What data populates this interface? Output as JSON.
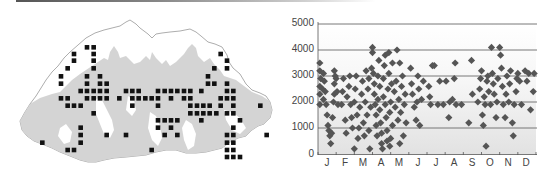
{
  "map": {
    "title": "",
    "description": "Distribution map of records (black squares) over Bhutan, grey shading = forest/lowland relief",
    "grid": {
      "x0": 42.3,
      "dx": 6.47,
      "y0": 47.3,
      "dy": 7.3,
      "cell": 4.6
    },
    "colors": {
      "square": "#111111",
      "relief": "#d4d4d4",
      "outline": "#8a8a8a",
      "land": "#ffffff"
    },
    "squares_3x": [
      [
        261,
        97
      ],
      [
        281,
        97
      ],
      [
        222,
        117
      ],
      [
        281,
        117
      ],
      [
        662,
        117
      ],
      [
        222,
        137
      ],
      [
        281,
        137
      ],
      [
        681,
        137
      ],
      [
        203,
        160
      ],
      [
        281,
        160
      ],
      [
        643,
        160
      ],
      [
        681,
        160
      ],
      [
        183,
        184
      ],
      [
        261,
        184
      ],
      [
        300,
        184
      ],
      [
        624,
        184
      ],
      [
        183,
        206
      ],
      [
        261,
        206
      ],
      [
        300,
        206
      ],
      [
        320,
        206
      ],
      [
        624,
        206
      ],
      [
        643,
        206
      ],
      [
        681,
        206
      ],
      [
        242,
        228
      ],
      [
        261,
        228
      ],
      [
        281,
        228
      ],
      [
        300,
        228
      ],
      [
        320,
        228
      ],
      [
        378,
        228
      ],
      [
        397,
        228
      ],
      [
        416,
        228
      ],
      [
        474,
        228
      ],
      [
        494,
        228
      ],
      [
        513,
        228
      ],
      [
        532,
        228
      ],
      [
        552,
        228
      ],
      [
        571,
        228
      ],
      [
        604,
        228
      ],
      [
        681,
        228
      ],
      [
        700,
        228
      ],
      [
        183,
        250
      ],
      [
        203,
        250
      ],
      [
        261,
        250
      ],
      [
        281,
        250
      ],
      [
        300,
        250
      ],
      [
        320,
        250
      ],
      [
        358,
        250
      ],
      [
        397,
        250
      ],
      [
        416,
        250
      ],
      [
        436,
        250
      ],
      [
        455,
        250
      ],
      [
        474,
        250
      ],
      [
        513,
        250
      ],
      [
        552,
        250
      ],
      [
        571,
        250
      ],
      [
        662,
        250
      ],
      [
        681,
        250
      ],
      [
        700,
        250
      ],
      [
        203,
        272
      ],
      [
        222,
        272
      ],
      [
        242,
        272
      ],
      [
        397,
        272
      ],
      [
        474,
        272
      ],
      [
        571,
        272
      ],
      [
        591,
        272
      ],
      [
        610,
        272
      ],
      [
        629,
        272
      ],
      [
        662,
        272
      ],
      [
        700,
        272
      ],
      [
        781,
        272
      ],
      [
        281,
        295
      ],
      [
        571,
        295
      ],
      [
        591,
        295
      ],
      [
        610,
        295
      ],
      [
        629,
        295
      ],
      [
        649,
        295
      ],
      [
        681,
        295
      ],
      [
        700,
        295
      ],
      [
        474,
        316
      ],
      [
        494,
        316
      ],
      [
        513,
        316
      ],
      [
        532,
        316
      ],
      [
        604,
        316
      ],
      [
        720,
        316
      ],
      [
        242,
        338
      ],
      [
        474,
        338
      ],
      [
        513,
        338
      ],
      [
        700,
        338
      ],
      [
        242,
        360
      ],
      [
        320,
        360
      ],
      [
        378,
        360
      ],
      [
        494,
        360
      ],
      [
        532,
        360
      ],
      [
        681,
        360
      ],
      [
        700,
        360
      ],
      [
        800,
        360
      ],
      [
        127,
        383
      ],
      [
        242,
        383
      ],
      [
        681,
        383
      ],
      [
        700,
        383
      ],
      [
        203,
        405
      ],
      [
        222,
        405
      ],
      [
        455,
        405
      ],
      [
        681,
        405
      ],
      [
        700,
        405
      ],
      [
        681,
        426
      ],
      [
        700,
        426
      ],
      [
        720,
        426
      ]
    ]
  },
  "chart_data": {
    "type": "scatter",
    "title": "",
    "xlabel": "",
    "ylabel": "",
    "categories": [
      "J",
      "F",
      "M",
      "A",
      "M",
      "J",
      "J",
      "A",
      "S",
      "O",
      "N",
      "D"
    ],
    "yticks": [
      0,
      1000,
      2000,
      3000,
      4000,
      5000
    ],
    "ylim": [
      0,
      5000
    ],
    "xlim": [
      0,
      12
    ],
    "grid": "horizontal",
    "legend": "none",
    "marker": "diamond",
    "marker_color": "#555555",
    "background": "gradient white (top) to light grey (bottom)",
    "series": [
      {
        "name": "records",
        "points": [
          [
            0.1,
            3500
          ],
          [
            0.1,
            3200
          ],
          [
            0.15,
            2900
          ],
          [
            0.1,
            2600
          ],
          [
            0.1,
            2300
          ],
          [
            0.1,
            1900
          ],
          [
            0.25,
            2500
          ],
          [
            0.3,
            2100
          ],
          [
            0.3,
            3100
          ],
          [
            0.35,
            2800
          ],
          [
            0.4,
            2400
          ],
          [
            0.45,
            1900
          ],
          [
            0.5,
            1500
          ],
          [
            0.55,
            1100
          ],
          [
            0.6,
            900
          ],
          [
            0.65,
            700
          ],
          [
            0.7,
            400
          ],
          [
            0.75,
            800
          ],
          [
            0.8,
            1400
          ],
          [
            0.85,
            2000
          ],
          [
            0.9,
            2300
          ],
          [
            0.9,
            2700
          ],
          [
            0.95,
            3000
          ],
          [
            0.9,
            3200
          ],
          [
            1.0,
            2900
          ],
          [
            1.05,
            2400
          ],
          [
            1.1,
            1900
          ],
          [
            1.3,
            1900
          ],
          [
            1.35,
            2400
          ],
          [
            1.4,
            2900
          ],
          [
            1.5,
            1300
          ],
          [
            1.55,
            800
          ],
          [
            1.6,
            2200
          ],
          [
            1.7,
            2600
          ],
          [
            1.75,
            3000
          ],
          [
            1.8,
            1900
          ],
          [
            1.85,
            1400
          ],
          [
            1.9,
            1000
          ],
          [
            2.0,
            200
          ],
          [
            2.0,
            2000
          ],
          [
            2.05,
            2500
          ],
          [
            2.1,
            3000
          ],
          [
            2.15,
            1500
          ],
          [
            2.2,
            600
          ],
          [
            2.25,
            1000
          ],
          [
            2.3,
            1800
          ],
          [
            2.4,
            2300
          ],
          [
            2.45,
            2800
          ],
          [
            2.5,
            1200
          ],
          [
            2.55,
            700
          ],
          [
            2.6,
            2000
          ],
          [
            2.65,
            3200
          ],
          [
            2.7,
            1500
          ],
          [
            2.75,
            2500
          ],
          [
            2.8,
            900
          ],
          [
            2.8,
            2900
          ],
          [
            2.85,
            200
          ],
          [
            2.9,
            1800
          ],
          [
            2.95,
            3300
          ],
          [
            3.0,
            3900
          ],
          [
            3.0,
            4100
          ],
          [
            3.05,
            3100
          ],
          [
            3.1,
            2700
          ],
          [
            3.1,
            2300
          ],
          [
            3.15,
            1900
          ],
          [
            3.2,
            1500
          ],
          [
            3.2,
            1100
          ],
          [
            3.25,
            700
          ],
          [
            3.3,
            3000
          ],
          [
            3.3,
            2100
          ],
          [
            3.35,
            3600
          ],
          [
            3.4,
            2600
          ],
          [
            3.4,
            1700
          ],
          [
            3.45,
            1200
          ],
          [
            3.5,
            800
          ],
          [
            3.5,
            400
          ],
          [
            3.55,
            200
          ],
          [
            3.6,
            2900
          ],
          [
            3.6,
            2200
          ],
          [
            3.65,
            3400
          ],
          [
            3.7,
            3800
          ],
          [
            3.7,
            1900
          ],
          [
            3.75,
            1400
          ],
          [
            3.8,
            900
          ],
          [
            3.8,
            500
          ],
          [
            3.85,
            2500
          ],
          [
            3.9,
            3100
          ],
          [
            3.9,
            3900
          ],
          [
            3.95,
            1600
          ],
          [
            3.95,
            300
          ],
          [
            4.0,
            2000
          ],
          [
            4.0,
            600
          ],
          [
            4.05,
            2700
          ],
          [
            4.1,
            3500
          ],
          [
            4.1,
            1100
          ],
          [
            4.2,
            2400
          ],
          [
            4.25,
            1800
          ],
          [
            4.3,
            2800
          ],
          [
            4.35,
            4000
          ],
          [
            4.4,
            1300
          ],
          [
            4.45,
            2100
          ],
          [
            4.5,
            3500
          ],
          [
            4.5,
            400
          ],
          [
            4.55,
            1600
          ],
          [
            4.6,
            2600
          ],
          [
            4.65,
            3000
          ],
          [
            4.7,
            700
          ],
          [
            4.75,
            1900
          ],
          [
            4.8,
            2300
          ],
          [
            4.85,
            1200
          ],
          [
            5.1,
            3300
          ],
          [
            5.15,
            2700
          ],
          [
            5.2,
            2300
          ],
          [
            5.3,
            1800
          ],
          [
            5.4,
            1300
          ],
          [
            5.45,
            2000
          ],
          [
            5.5,
            3000
          ],
          [
            5.55,
            2500
          ],
          [
            5.6,
            1100
          ],
          [
            5.7,
            2100
          ],
          [
            5.8,
            2800
          ],
          [
            6.1,
            2600
          ],
          [
            6.15,
            2200
          ],
          [
            6.2,
            1900
          ],
          [
            6.3,
            3400
          ],
          [
            6.4,
            3400
          ],
          [
            6.6,
            1900
          ],
          [
            6.7,
            2800
          ],
          [
            6.9,
            1900
          ],
          [
            7.05,
            2800
          ],
          [
            7.2,
            1400
          ],
          [
            7.25,
            2000
          ],
          [
            7.4,
            2100
          ],
          [
            7.5,
            2900
          ],
          [
            7.55,
            3500
          ],
          [
            7.6,
            1900
          ],
          [
            7.9,
            1900
          ],
          [
            8.3,
            1200
          ],
          [
            8.45,
            3600
          ],
          [
            8.5,
            2300
          ],
          [
            8.8,
            2000
          ],
          [
            8.9,
            2500
          ],
          [
            8.95,
            2900
          ],
          [
            9.0,
            3200
          ],
          [
            9.05,
            1500
          ],
          [
            9.1,
            1100
          ],
          [
            9.15,
            2200
          ],
          [
            9.2,
            1900
          ],
          [
            9.25,
            300
          ],
          [
            9.3,
            2800
          ],
          [
            9.35,
            3000
          ],
          [
            9.4,
            2400
          ],
          [
            9.5,
            1900
          ],
          [
            9.55,
            4100
          ],
          [
            9.6,
            3100
          ],
          [
            9.65,
            2700
          ],
          [
            9.7,
            2300
          ],
          [
            9.8,
            1400
          ],
          [
            9.85,
            2000
          ],
          [
            9.9,
            2900
          ],
          [
            10.0,
            4100
          ],
          [
            10.05,
            3800
          ],
          [
            10.1,
            3300
          ],
          [
            10.15,
            2600
          ],
          [
            10.2,
            1900
          ],
          [
            10.3,
            1400
          ],
          [
            10.35,
            2300
          ],
          [
            10.4,
            3000
          ],
          [
            10.5,
            2000
          ],
          [
            10.55,
            2700
          ],
          [
            10.6,
            3200
          ],
          [
            10.7,
            1200
          ],
          [
            10.75,
            700
          ],
          [
            10.8,
            1900
          ],
          [
            10.9,
            2400
          ],
          [
            10.95,
            2900
          ],
          [
            11.0,
            3100
          ],
          [
            11.1,
            2800
          ],
          [
            11.2,
            1900
          ],
          [
            11.4,
            3200
          ],
          [
            11.5,
            2800
          ],
          [
            11.6,
            3100
          ],
          [
            11.7,
            1700
          ],
          [
            11.85,
            2400
          ],
          [
            11.9,
            3100
          ]
        ]
      }
    ]
  },
  "axis": {
    "y_labels": [
      "5000",
      "4000",
      "3000",
      "2000",
      "1000",
      "0"
    ],
    "x_labels": [
      "J",
      "F",
      "M",
      "A",
      "M",
      "J",
      "J",
      "A",
      "S",
      "O",
      "N",
      "D"
    ]
  }
}
